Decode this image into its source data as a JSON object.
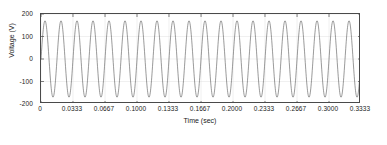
{
  "chart_data": {
    "type": "line",
    "title": "",
    "xlabel": "Time (sec)",
    "ylabel": "Voltage (V)",
    "xlim": [
      0,
      0.3333
    ],
    "ylim": [
      -200,
      200
    ],
    "grid": true,
    "legend": null,
    "series": [
      {
        "name": "Voltage",
        "waveform": "sine",
        "frequency_hz": 60,
        "amplitude_v": 170,
        "phase_rad": 0,
        "color": "#555555",
        "samples_per_cycle": 64,
        "n_cycles": 20
      }
    ],
    "x_ticks": [
      0,
      0.0333,
      0.0667,
      0.1,
      0.1333,
      0.1667,
      0.2,
      0.2333,
      0.2667,
      0.3,
      0.3333
    ],
    "x_tick_labels": [
      "0",
      "0.0333",
      "0.0667",
      "0.1000",
      "0.1333",
      "0.1667",
      "0.2000",
      "0.2333",
      "0.2667",
      "0.3000",
      "0.3333"
    ],
    "y_ticks": [
      200,
      100,
      0,
      -100,
      -200
    ],
    "y_tick_labels": [
      "200",
      "100",
      "0",
      "-100",
      "-200"
    ],
    "colors": {
      "trace": "#555555",
      "axis": "#4a4a4a",
      "grid": "#d8d8d8",
      "text": "#1a1a1a",
      "background": "#ffffff"
    }
  }
}
